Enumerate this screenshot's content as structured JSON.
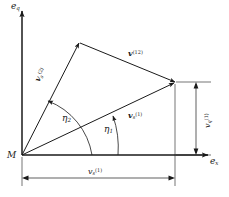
{
  "figure": {
    "type": "vector-diagram",
    "axes": {
      "vertical_label_base": "e",
      "vertical_label_sub": "q",
      "horizontal_label_base": "e",
      "horizontal_label_sub": "x"
    },
    "origin_label": "M",
    "vectors": [
      {
        "name": "v-s-1",
        "base": "v",
        "sub": "s",
        "sup": "(1)"
      },
      {
        "name": "v-s-2",
        "base": "v",
        "sub": "s",
        "sup": "(2)"
      },
      {
        "name": "v-12",
        "base": "v",
        "sub": "",
        "sup": "(12)"
      }
    ],
    "angles": [
      {
        "name": "eta1",
        "symbol": "η",
        "sub": "1"
      },
      {
        "name": "eta2",
        "symbol": "η",
        "sub": "2"
      }
    ],
    "dimensions": [
      {
        "name": "horizontal-extent",
        "base": "v",
        "sub": "s",
        "sup": "(1)"
      },
      {
        "name": "vertical-extent",
        "base": "v",
        "sub": "q",
        "sup": "(1)"
      }
    ],
    "colors": {
      "line": "#1a1a1a",
      "background": "#ffffff"
    }
  }
}
